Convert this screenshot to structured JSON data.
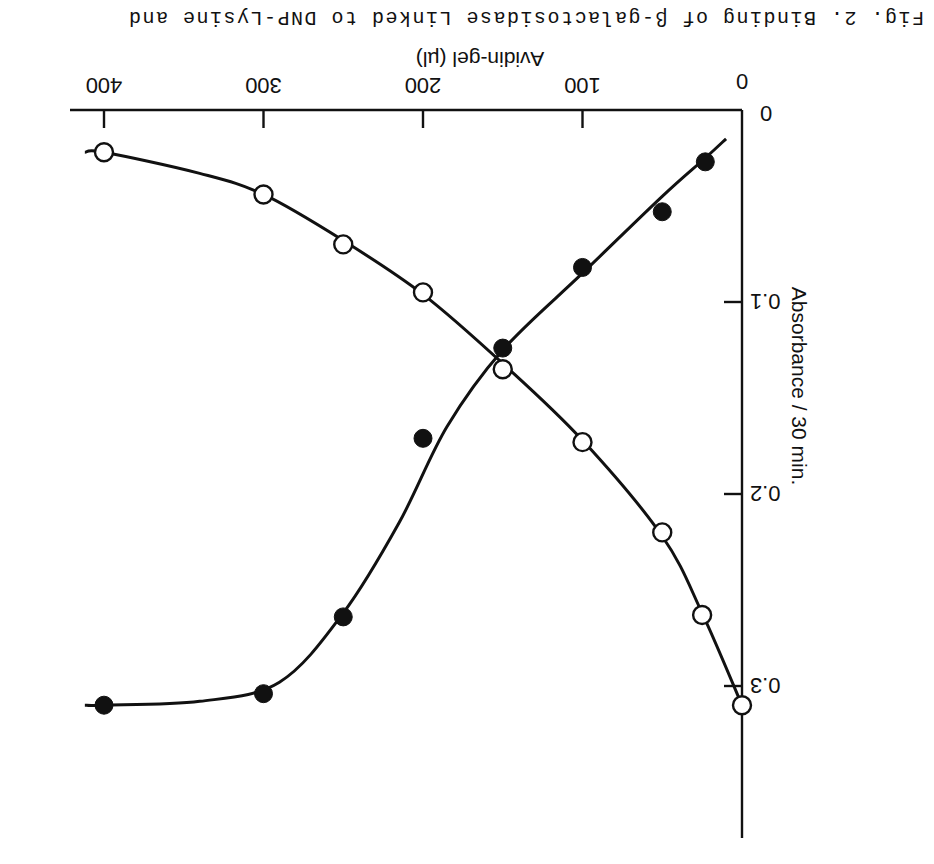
{
  "caption": "Fig. 2. Binding of β-galactosidase Linked to DNP-Lysine and",
  "orientation": "rotated 180 degrees",
  "chart_data": {
    "type": "scatter",
    "title": "",
    "xlabel": "Avidin-gel (µl)",
    "ylabel": "Absorbance / 30 min.",
    "xlim": [
      0,
      420
    ],
    "ylim": [
      0,
      0.4
    ],
    "x_ticks": [
      0,
      100,
      200,
      300,
      400
    ],
    "x_tick_labels": [
      "0",
      "100",
      "200",
      "300",
      "400"
    ],
    "y_ticks": [
      0,
      0.1,
      0.2,
      0.3
    ],
    "y_tick_labels": [
      "0",
      "0.1",
      "0.2",
      "0.3"
    ],
    "grid": false,
    "legend": null,
    "series": [
      {
        "name": "filled circles (●)",
        "marker": "filled-circle",
        "line": "smooth fitted curve",
        "x": [
          23,
          50,
          100,
          150,
          200,
          250,
          300,
          400
        ],
        "y": [
          0.027,
          0.053,
          0.082,
          0.124,
          0.171,
          0.264,
          0.304,
          0.31
        ]
      },
      {
        "name": "open circles (○)",
        "marker": "open-circle",
        "line": "smooth fitted curve",
        "x": [
          400,
          300,
          250,
          200,
          150,
          100,
          50,
          25,
          0
        ],
        "y": [
          0.022,
          0.044,
          0.07,
          0.095,
          0.135,
          0.173,
          0.22,
          0.263,
          0.31
        ]
      }
    ],
    "annotations": [
      "curves cross near x≈150 µl, y≈0.125"
    ]
  }
}
